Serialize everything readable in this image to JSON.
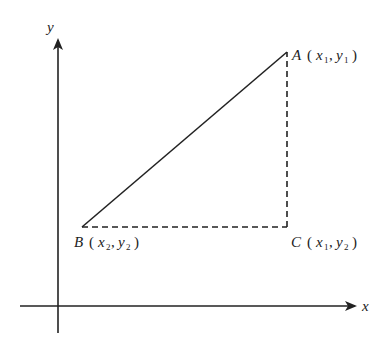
{
  "diagram": {
    "title": "",
    "axes": {
      "x_label": "x",
      "y_label": "y"
    },
    "points": {
      "A": {
        "name": "A",
        "coord_x": "x",
        "coord_x_sub": "1",
        "coord_y": "y",
        "coord_y_sub": "1"
      },
      "B": {
        "name": "B",
        "coord_x": "x",
        "coord_x_sub": "2",
        "coord_y": "y",
        "coord_y_sub": "2"
      },
      "C": {
        "name": "C",
        "coord_x": "x",
        "coord_x_sub": "1",
        "coord_y": "y",
        "coord_y_sub": "2"
      }
    },
    "segments": [
      {
        "from": "B",
        "to": "A",
        "style": "solid"
      },
      {
        "from": "B",
        "to": "C",
        "style": "dashed"
      },
      {
        "from": "C",
        "to": "A",
        "style": "dashed"
      }
    ],
    "punctuation": {
      "open": "(",
      "comma": ",",
      "close": ")"
    },
    "colors": {
      "line": "#222222",
      "background": "#ffffff"
    }
  }
}
